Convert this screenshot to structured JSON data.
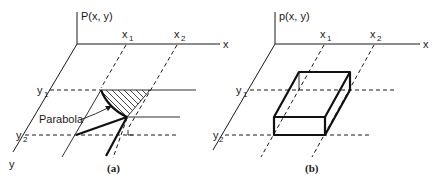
{
  "figure": {
    "panels": [
      {
        "id": "a",
        "caption": "(a)",
        "z_label": "P(x, y)",
        "x_label": "x",
        "y_label": "y",
        "x_ticks": [
          {
            "base": "x",
            "sub": "1"
          },
          {
            "base": "x",
            "sub": "2"
          }
        ],
        "y_ticks": [
          {
            "base": "y",
            "sub": "1"
          },
          {
            "base": "y",
            "sub": "2"
          }
        ],
        "annotation": "Parabola"
      },
      {
        "id": "b",
        "caption": "(b)",
        "z_label": "p(x, y)",
        "x_label": "x",
        "y_label": "y",
        "x_ticks": [
          {
            "base": "x",
            "sub": "1"
          },
          {
            "base": "x",
            "sub": "2"
          }
        ],
        "y_ticks": [
          {
            "base": "y",
            "sub": "1"
          },
          {
            "base": "y",
            "sub": "2"
          }
        ]
      }
    ]
  }
}
